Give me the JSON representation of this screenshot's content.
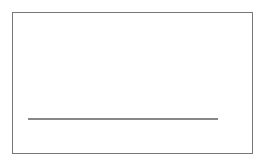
{
  "chart_data": {
    "type": "area",
    "title": "",
    "xlabel": "X",
    "ylabel": "",
    "xlim": [
      5,
      70
    ],
    "x_ticks": [
      10,
      20,
      30,
      40,
      50,
      60,
      70
    ],
    "x": [
      5,
      10,
      15,
      20,
      22,
      25,
      30,
      31,
      35,
      40,
      45,
      50,
      55,
      60,
      65,
      70
    ],
    "values": [
      0,
      0.01,
      0.06,
      0.33,
      0.58,
      0.8,
      0.95,
      0.96,
      0.87,
      0.65,
      0.44,
      0.28,
      0.16,
      0.1,
      0.05,
      0
    ],
    "fill": "vertical-hatch",
    "annotations": [
      {
        "label": "A",
        "x": 35.5,
        "type": "highlighted-strip"
      },
      {
        "label": "B",
        "x": 46,
        "type": "highlighted-strip"
      }
    ],
    "grid": false,
    "legend": null
  },
  "labels": {
    "A": "A",
    "B": "B",
    "axis_x": "X",
    "ticks": [
      "10",
      "20",
      "30",
      "40",
      "50",
      "60",
      "70"
    ]
  }
}
